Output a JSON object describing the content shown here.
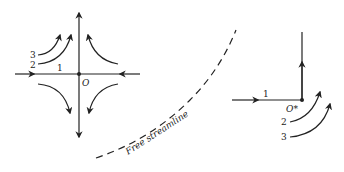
{
  "figure": {
    "left_diagram": {
      "origin_label": "O",
      "streamline_labels": [
        "1",
        "2",
        "3"
      ]
    },
    "divider": {
      "label": "Free streamline"
    },
    "right_diagram": {
      "origin_label": "O*",
      "streamline_labels": [
        "1",
        "2",
        "3"
      ]
    }
  },
  "colors": {
    "ink": "#222222",
    "background": "#ffffff"
  }
}
